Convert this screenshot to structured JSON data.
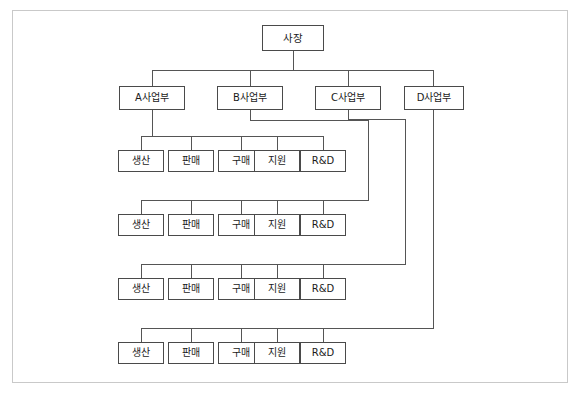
{
  "diagram": {
    "type": "organization-chart",
    "title_text": "",
    "orientation": "top-down",
    "frame": {
      "visible": true,
      "color": "#c9c9c9"
    },
    "line_color": "#555555",
    "box_border_color": "#4a4a4a",
    "box_fill_color": "#ffffff",
    "text_color": "#1a1a1a",
    "levels": [
      {
        "level": 1,
        "name": "executive",
        "nodes": [
          {
            "id": "ceo",
            "label": "사장",
            "x": 262,
            "y": 25,
            "w": 62,
            "h": 26
          }
        ]
      },
      {
        "level": 2,
        "name": "divisions",
        "nodes": [
          {
            "id": "div_a",
            "label": "A사업부",
            "x": 119,
            "y": 86,
            "w": 66,
            "h": 24
          },
          {
            "id": "div_b",
            "label": "B사업부",
            "x": 217,
            "y": 86,
            "w": 66,
            "h": 24
          },
          {
            "id": "div_c",
            "label": "C사업부",
            "x": 315,
            "y": 86,
            "w": 66,
            "h": 24
          },
          {
            "id": "div_d",
            "label": "D사업부",
            "x": 404,
            "y": 86,
            "w": 60,
            "h": 24
          }
        ]
      },
      {
        "level": 3,
        "name": "departments",
        "rows": [
          {
            "row": 1,
            "parent": "div_a",
            "y": 150,
            "nodes": [
              {
                "id": "r1_c1",
                "label": "생산",
                "x": 118,
                "w": 46,
                "h": 22
              },
              {
                "id": "r1_c2",
                "label": "판매",
                "x": 168,
                "w": 46,
                "h": 22
              },
              {
                "id": "r1_c3",
                "label": "구매",
                "x": 218,
                "w": 46,
                "h": 22
              },
              {
                "id": "r1_c4",
                "label": "지원",
                "x": 254,
                "w": 46,
                "h": 22
              },
              {
                "id": "r1_c5",
                "label": "R&D",
                "x": 300,
                "w": 46,
                "h": 22
              }
            ]
          },
          {
            "row": 2,
            "parent": "div_b",
            "y": 214,
            "nodes": [
              {
                "id": "r2_c1",
                "label": "생산",
                "x": 118,
                "w": 46,
                "h": 22
              },
              {
                "id": "r2_c2",
                "label": "판매",
                "x": 168,
                "w": 46,
                "h": 22
              },
              {
                "id": "r2_c3",
                "label": "구매",
                "x": 218,
                "w": 46,
                "h": 22
              },
              {
                "id": "r2_c4",
                "label": "지원",
                "x": 254,
                "w": 46,
                "h": 22
              },
              {
                "id": "r2_c5",
                "label": "R&D",
                "x": 300,
                "w": 46,
                "h": 22
              }
            ]
          },
          {
            "row": 3,
            "parent": "div_c",
            "y": 278,
            "nodes": [
              {
                "id": "r3_c1",
                "label": "생산",
                "x": 118,
                "w": 46,
                "h": 22
              },
              {
                "id": "r3_c2",
                "label": "판매",
                "x": 168,
                "w": 46,
                "h": 22
              },
              {
                "id": "r3_c3",
                "label": "구매",
                "x": 218,
                "w": 46,
                "h": 22
              },
              {
                "id": "r3_c4",
                "label": "지원",
                "x": 254,
                "w": 46,
                "h": 22
              },
              {
                "id": "r3_c5",
                "label": "R&D",
                "x": 300,
                "w": 46,
                "h": 22
              }
            ]
          },
          {
            "row": 4,
            "parent": "div_d",
            "y": 342,
            "nodes": [
              {
                "id": "r4_c1",
                "label": "생산",
                "x": 118,
                "w": 46,
                "h": 22
              },
              {
                "id": "r4_c2",
                "label": "판매",
                "x": 168,
                "w": 46,
                "h": 22
              },
              {
                "id": "r4_c3",
                "label": "구매",
                "x": 218,
                "w": 46,
                "h": 22
              },
              {
                "id": "r4_c4",
                "label": "지원",
                "x": 254,
                "w": 46,
                "h": 22
              },
              {
                "id": "r4_c5",
                "label": "R&D",
                "x": 300,
                "w": 46,
                "h": 22
              }
            ]
          }
        ]
      }
    ],
    "labels": {
      "ceo": "사장",
      "div_a": "A사업부",
      "div_b": "B사업부",
      "div_c": "C사업부",
      "div_d": "D사업부",
      "dept_production": "생산",
      "dept_sales": "판매",
      "dept_purchasing": "구매",
      "dept_support": "지원",
      "dept_rnd": "R&D"
    }
  }
}
